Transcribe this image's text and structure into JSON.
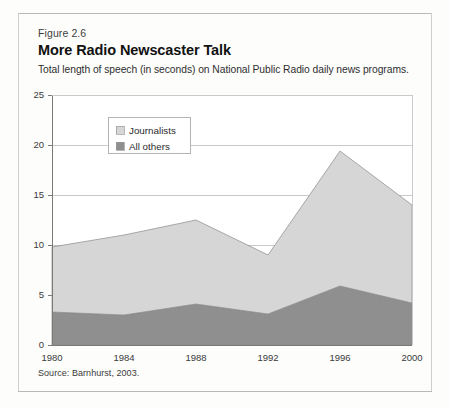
{
  "figure": {
    "number": "Figure 2.6",
    "title": "More Radio Newscaster Talk",
    "subtitle": "Total length of speech (in seconds) on National Public Radio daily news programs.",
    "source": "Source: Barnhurst, 2003."
  },
  "colors": {
    "journalists_fill": "#d6d6d6",
    "all_others_fill": "#8f8f8f",
    "series_outline": "#8a8a8a",
    "gridline": "#c9c9c9",
    "axis": "#7a7a7a",
    "plot_background": "#ffffff",
    "text": "#2e2e2e"
  },
  "chart_data": {
    "type": "area",
    "stacked": true,
    "title": "More Radio Newscaster Talk",
    "subtitle": "Total length of speech (in seconds) on National Public Radio daily news programs.",
    "xlabel": "",
    "ylabel": "",
    "x": [
      1980,
      1984,
      1988,
      1992,
      1996,
      2000
    ],
    "categories": [
      "1980",
      "1984",
      "1988",
      "1992",
      "1996",
      "2000"
    ],
    "xtick_labels": [
      "1980",
      "1984",
      "1988",
      "1992",
      "1996",
      "2000"
    ],
    "ytick_labels": [
      "0",
      "5",
      "10",
      "15",
      "20",
      "25"
    ],
    "yticks": [
      0,
      5,
      10,
      15,
      20,
      25
    ],
    "ylim": [
      0,
      25
    ],
    "grid": true,
    "grid_axis": "y",
    "legend_position": "upper-left-inside",
    "series": [
      {
        "name": "All others",
        "key": "all_others",
        "color": "#8f8f8f",
        "values": [
          3.3,
          3.0,
          4.1,
          3.1,
          5.9,
          4.2
        ]
      },
      {
        "name": "Journalists",
        "key": "journalists",
        "color": "#d6d6d6",
        "values": [
          6.5,
          8.0,
          8.4,
          5.9,
          13.5,
          9.8
        ]
      }
    ],
    "totals": [
      9.8,
      11.0,
      12.5,
      9.0,
      19.4,
      14.0
    ],
    "legend": [
      {
        "label": "Journalists",
        "swatch": "#d6d6d6"
      },
      {
        "label": "All others",
        "swatch": "#8f8f8f"
      }
    ]
  },
  "plot_geometry": {
    "left": 52,
    "right": 412,
    "top": 95,
    "bottom": 345
  }
}
